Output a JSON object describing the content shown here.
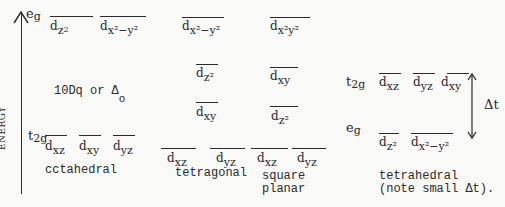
{
  "axis": {
    "label": "ENERGY"
  },
  "octahedral": {
    "title": "cctahedral",
    "eg_label": "e",
    "eg_sub": "g",
    "t2g_label": "t",
    "t2g_sub": "2g",
    "splitting_label": "10Dq or Δ",
    "splitting_sub": "o",
    "eg_orbitals": [
      {
        "d": "d",
        "sub": "z",
        "sup": "2"
      },
      {
        "d": "d",
        "sub": "x²−y²",
        "sup": ""
      }
    ],
    "t2g_orbitals": [
      {
        "d": "d",
        "sub": "xz"
      },
      {
        "d": "d",
        "sub": "xy"
      },
      {
        "d": "d",
        "sub": "yz"
      }
    ]
  },
  "tetragonal": {
    "title": "tetragonal",
    "levels": [
      {
        "d": "d",
        "sub": "x²−y²"
      },
      {
        "d": "d",
        "sub": "z²"
      },
      {
        "d": "d",
        "sub": "xy"
      },
      {
        "d": "d",
        "sub": "xz"
      },
      {
        "d": "d",
        "sub": "yz"
      }
    ]
  },
  "square_planar": {
    "title_line1": "square",
    "title_line2": "planar",
    "levels": [
      {
        "d": "d",
        "sub": "x²y²"
      },
      {
        "d": "d",
        "sub": "xy"
      },
      {
        "d": "d",
        "sub": "z²"
      },
      {
        "d": "d",
        "sub": "xz"
      },
      {
        "d": "d",
        "sub": "yz"
      }
    ]
  },
  "tetrahedral": {
    "title_line1": "tetrahedral",
    "title_line2": "(note small Δt).",
    "t2g_label": "t",
    "t2g_sub": "2g",
    "eg_label": "e",
    "eg_sub": "g",
    "splitting_label": "Δt",
    "t2g_orbitals": [
      {
        "d": "d",
        "sub": "xz"
      },
      {
        "d": "d",
        "sub": "yz"
      },
      {
        "d": "d",
        "sub": "xy"
      }
    ],
    "eg_orbitals": [
      {
        "d": "d",
        "sub": "z²"
      },
      {
        "d": "d",
        "sub": "x²−y²"
      }
    ]
  }
}
